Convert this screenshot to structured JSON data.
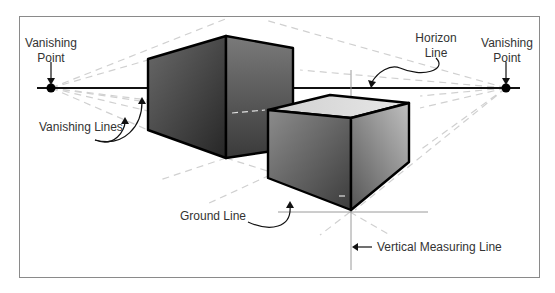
{
  "diagram": {
    "type": "two-point perspective",
    "labels": {
      "vp_left": [
        "Vanishing",
        "Point"
      ],
      "vp_right": [
        "Vanishing",
        "Point"
      ],
      "horizon": [
        "Horizon",
        "Line"
      ],
      "vanishing_lines": "Vanishing Lines",
      "ground_line": "Ground Line",
      "vertical_measuring_line": "Vertical Measuring Line"
    },
    "colors": {
      "frame": "#8a8a8a",
      "line": "#111111",
      "guide": "#cfcfcf",
      "box_dark": "#2e2e2e",
      "box_light": "#b5b5b5",
      "text": "#333333"
    }
  }
}
